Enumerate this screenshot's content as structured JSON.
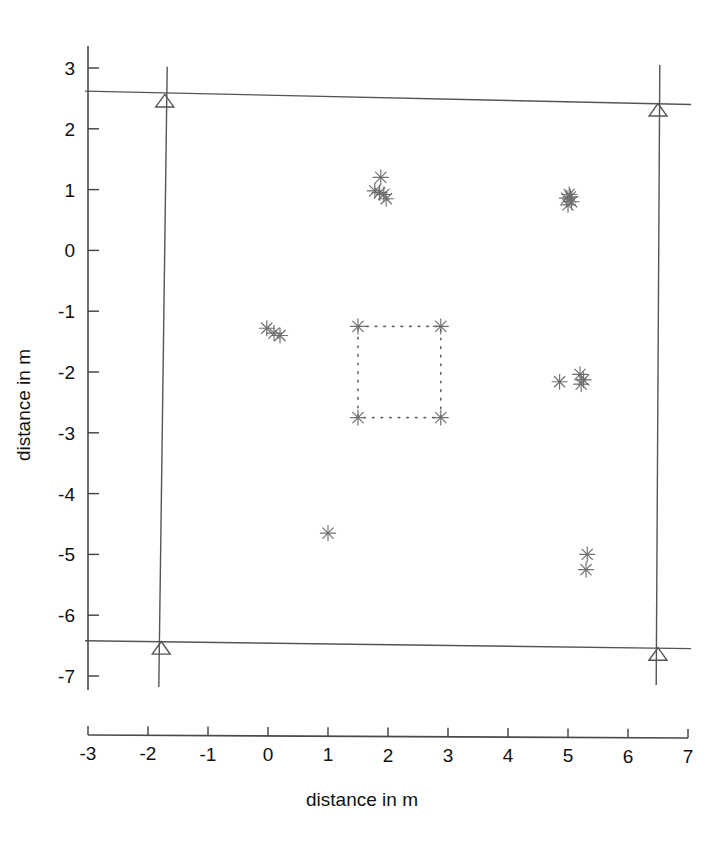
{
  "figure": {
    "background_color": "#ffffff",
    "line_color": "#555555",
    "marker_color": "#6e6e6e",
    "text_color": "#111111"
  },
  "chart_data": {
    "type": "scatter",
    "title": "",
    "xlabel": "distance in m",
    "ylabel": "distance in m",
    "xlim": [
      -3,
      7
    ],
    "ylim": [
      -7,
      3
    ],
    "xticks": [
      -3,
      -2,
      -1,
      0,
      1,
      2,
      3,
      4,
      5,
      6,
      7
    ],
    "xtick_labels": [
      "-3",
      "-2",
      "-1",
      "0",
      "1",
      "2",
      "3",
      "4",
      "5",
      "6",
      "7"
    ],
    "yticks": [
      -7,
      -6,
      -5,
      -4,
      -3,
      -2,
      -1,
      0,
      1,
      2,
      3
    ],
    "ytick_labels": [
      "-7",
      "-6",
      "-5",
      "-4",
      "-3",
      "-2",
      "-1",
      "0",
      "1",
      "2",
      "3"
    ],
    "grid": false,
    "legend": null,
    "series": [
      {
        "name": "estimated positions",
        "marker": "asterisk",
        "color": "#6e6e6e",
        "points": [
          [
            1.88,
            1.2
          ],
          [
            1.78,
            0.98
          ],
          [
            1.93,
            0.92
          ],
          [
            1.97,
            0.85
          ],
          [
            1.86,
            0.95
          ],
          [
            5.02,
            0.92
          ],
          [
            4.98,
            0.86
          ],
          [
            5.06,
            0.8
          ],
          [
            5.0,
            0.75
          ],
          [
            5.04,
            0.88
          ],
          [
            -0.02,
            -1.28
          ],
          [
            0.1,
            -1.36
          ],
          [
            0.2,
            -1.4
          ],
          [
            1.5,
            -1.25
          ],
          [
            2.88,
            -1.25
          ],
          [
            1.5,
            -2.75
          ],
          [
            2.88,
            -2.75
          ],
          [
            4.86,
            -2.16
          ],
          [
            5.2,
            -2.04
          ],
          [
            5.26,
            -2.13
          ],
          [
            5.22,
            -2.2
          ],
          [
            1.0,
            -4.65
          ],
          [
            5.32,
            -5.0
          ],
          [
            5.3,
            -5.25
          ]
        ]
      },
      {
        "name": "anchor nodes",
        "marker": "triangle",
        "color": "#555555",
        "points": [
          [
            -1.72,
            2.5
          ],
          [
            6.5,
            2.35
          ],
          [
            -1.78,
            -6.5
          ],
          [
            6.5,
            -6.6
          ]
        ]
      }
    ],
    "shapes": [
      {
        "name": "room-outline-top",
        "type": "line",
        "style": "solid",
        "points": [
          [
            -3.05,
            2.62
          ],
          [
            7.05,
            2.4
          ]
        ]
      },
      {
        "name": "room-outline-bottom",
        "type": "line",
        "style": "solid",
        "points": [
          [
            -3.05,
            -6.42
          ],
          [
            7.05,
            -6.55
          ]
        ]
      },
      {
        "name": "room-outline-left",
        "type": "line",
        "style": "solid",
        "points": [
          [
            -1.68,
            3.02
          ],
          [
            -1.82,
            -7.18
          ]
        ]
      },
      {
        "name": "room-outline-right",
        "type": "line",
        "style": "solid",
        "points": [
          [
            6.53,
            3.05
          ],
          [
            6.47,
            -7.15
          ]
        ]
      },
      {
        "name": "inner-dotted-square",
        "type": "rect",
        "style": "dotted",
        "x0": 1.5,
        "y0": -2.75,
        "x1": 2.88,
        "y1": -1.25
      }
    ]
  }
}
